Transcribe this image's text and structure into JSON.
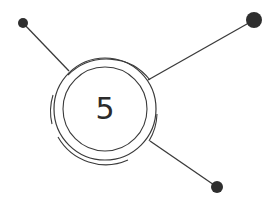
{
  "diagram": {
    "center_label": "5",
    "colors": {
      "stroke": "#3a3a3a",
      "node": "#2e2e2e",
      "text": "#2b2b2b",
      "background": "#ffffff"
    },
    "hub": {
      "cx": 105,
      "cy": 109,
      "inner_r": 42,
      "outer_r": 51
    },
    "nodes": [
      {
        "name": "top-left",
        "x": 23,
        "y": 23,
        "r": 5
      },
      {
        "name": "top-right",
        "x": 254,
        "y": 20,
        "r": 8
      },
      {
        "name": "bottom-right",
        "x": 217,
        "y": 187,
        "r": 6
      }
    ]
  }
}
